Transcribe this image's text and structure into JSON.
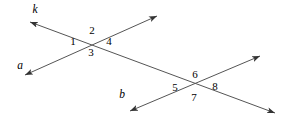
{
  "figure": {
    "background_color": "#ffffff",
    "line_color": "#555555",
    "text_color": "#000000",
    "width": 297,
    "height": 127
  },
  "lines": [
    {
      "id": "k",
      "name": "k",
      "role": "transversal",
      "label": "k",
      "label_x": 35,
      "label_y": 10,
      "x1": 30,
      "y1": 22,
      "x2": 275,
      "y2": 113,
      "arrow_start": true,
      "arrow_end": true
    },
    {
      "id": "a",
      "name": "a",
      "role": "parallel-line-upper",
      "label": "a",
      "label_x": 20,
      "label_y": 66,
      "x1": 25,
      "y1": 75,
      "x2": 157,
      "y2": 16,
      "arrow_start": true,
      "arrow_end": true
    },
    {
      "id": "b",
      "name": "b",
      "role": "parallel-line-lower",
      "label": "b",
      "label_x": 122,
      "label_y": 95,
      "x1": 130,
      "y1": 111,
      "x2": 260,
      "y2": 56,
      "arrow_start": true,
      "arrow_end": true
    }
  ],
  "intersections": [
    {
      "id": "upper",
      "name": "intersection-k-a",
      "x": 90,
      "y": 38,
      "angles": [
        {
          "label": "1",
          "x": 73,
          "y": 41,
          "position": "left"
        },
        {
          "label": "2",
          "x": 92,
          "y": 30,
          "position": "top"
        },
        {
          "label": "4",
          "x": 109,
          "y": 41,
          "position": "right"
        },
        {
          "label": "3",
          "x": 91,
          "y": 52,
          "position": "bottom"
        }
      ]
    },
    {
      "id": "lower",
      "name": "intersection-k-b",
      "x": 196,
      "y": 78,
      "angles": [
        {
          "label": "5",
          "x": 175,
          "y": 87,
          "position": "left"
        },
        {
          "label": "6",
          "x": 195,
          "y": 74,
          "position": "top"
        },
        {
          "label": "8",
          "x": 215,
          "y": 86,
          "position": "right"
        },
        {
          "label": "7",
          "x": 194,
          "y": 97,
          "position": "bottom"
        }
      ]
    }
  ]
}
